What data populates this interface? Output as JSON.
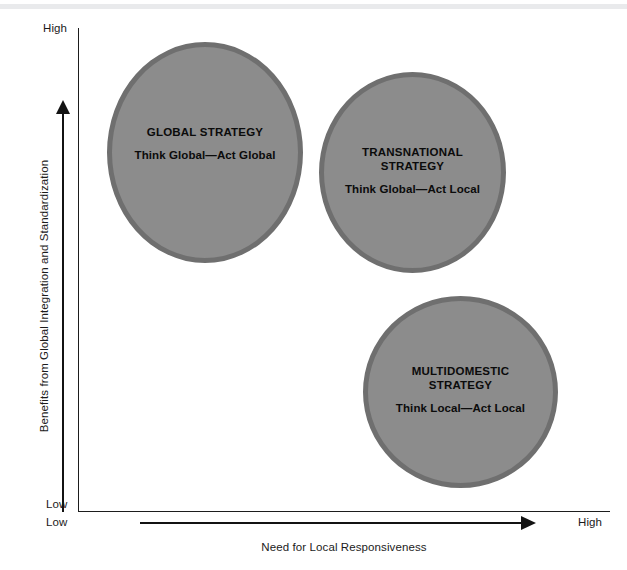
{
  "figure": {
    "type": "bubble-matrix-diagram",
    "background_color": "#ffffff",
    "bubble_fill_color": "#8c8c8c",
    "bubble_ring_color": "#6f6f6f",
    "text_color": "#0b0b0b"
  },
  "axes": {
    "y": {
      "title": "Benefits from Global Integration and Standardization",
      "low_label": "Low",
      "high_label": "High",
      "direction": "upward"
    },
    "x": {
      "title": "Need for Local Responsiveness",
      "low_label": "Low",
      "high_label": "High",
      "direction": "rightward"
    }
  },
  "chart_data": {
    "type": "scatter",
    "title": "",
    "xlabel": "Need for Local Responsiveness",
    "ylabel": "Benefits from Global Integration and Standardization",
    "xlim": [
      "Low",
      "High"
    ],
    "ylim": [
      "Low",
      "High"
    ],
    "grid": false,
    "legend": "none",
    "points": [
      {
        "name": "GLOBAL STRATEGY",
        "tagline": "Think Global—Act Global",
        "x_qualitative": "Low",
        "y_qualitative": "High"
      },
      {
        "name": "TRANSNATIONAL STRATEGY",
        "tagline": "Think Global—Act Local",
        "x_qualitative": "Medium-High",
        "y_qualitative": "Medium-High"
      },
      {
        "name": "MULTIDOMESTIC STRATEGY",
        "tagline": "Think Local—Act Local",
        "x_qualitative": "High",
        "y_qualitative": "Low-Medium"
      }
    ]
  },
  "bubbles": [
    {
      "id": "global",
      "title_lines": [
        "GLOBAL STRATEGY"
      ],
      "title": "GLOBAL STRATEGY",
      "subtitle": "Think Global—Act Global"
    },
    {
      "id": "transnational",
      "title_lines": [
        "TRANSNATIONAL",
        "STRATEGY"
      ],
      "title_line1": "TRANSNATIONAL",
      "title_line2": "STRATEGY",
      "subtitle": "Think Global—Act Local"
    },
    {
      "id": "multidomestic",
      "title_lines": [
        "MULTIDOMESTIC",
        "STRATEGY"
      ],
      "title_line1": "MULTIDOMESTIC",
      "title_line2": "STRATEGY",
      "subtitle": "Think Local—Act Local"
    }
  ]
}
